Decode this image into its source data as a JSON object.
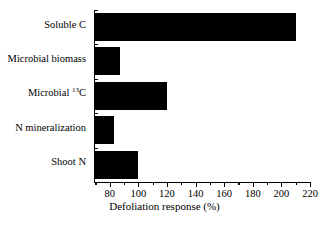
{
  "chart_data": {
    "type": "bar",
    "orientation": "horizontal",
    "title": "",
    "xlabel": "Defoliation response (%)",
    "ylabel": "",
    "xlim": [
      69,
      220
    ],
    "ylim": null,
    "grid": false,
    "legend": null,
    "bar_color": "#000000",
    "axis_color": "#000000",
    "background_color": "#ffffff",
    "categories": [
      "Soluble C",
      "Microbial biomass",
      "Microbial 13C",
      "N mineralization",
      "Shoot N"
    ],
    "category_labels_html": [
      "Soluble C",
      "Microbial biomass",
      "Microbial <sup>13</sup>C",
      "N mineralization",
      "Shoot N"
    ],
    "values": [
      210,
      87,
      120,
      83,
      100
    ],
    "xticks": [
      80,
      100,
      120,
      140,
      160,
      180,
      200,
      220
    ],
    "xtick_labels": [
      "80",
      "100",
      "120",
      "140",
      "160",
      "180",
      "200",
      "220"
    ],
    "xticks_minor": [
      70,
      90,
      110,
      130,
      150,
      170,
      190,
      210
    ],
    "reference_value": 100
  },
  "axis": {
    "x_title": "Defoliation response (%)"
  }
}
